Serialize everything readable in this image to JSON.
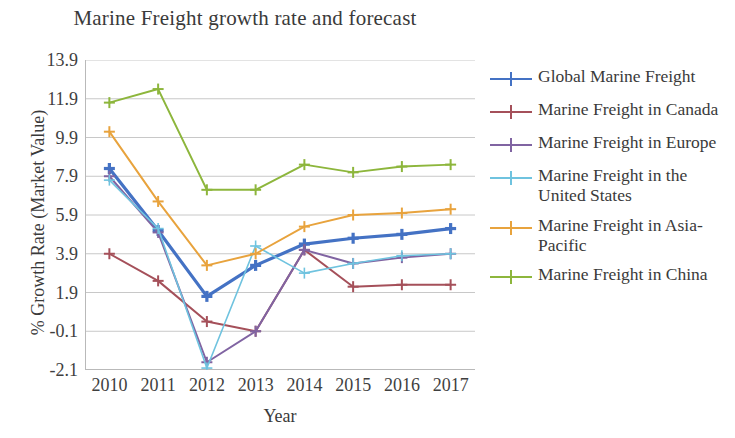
{
  "chart_data": {
    "type": "line",
    "title": "Marine Freight growth rate and forecast",
    "xlabel": "Year",
    "ylabel": "% Growth Rate (Market Value)",
    "categories": [
      "2010",
      "2011",
      "2012",
      "2013",
      "2014",
      "2015",
      "2016",
      "2017"
    ],
    "x_tick_labels": [
      "2010",
      "2011",
      "2012",
      "2013",
      "2014",
      "2015",
      "2016",
      "2017"
    ],
    "y_tick_labels": [
      "13.9",
      "11.9",
      "9.9",
      "7.9",
      "5.9",
      "3.9",
      "1.9",
      "-0.1",
      "-2.1"
    ],
    "y_ticks": [
      13.9,
      11.9,
      9.9,
      7.9,
      5.9,
      3.9,
      1.9,
      -0.1,
      -2.1
    ],
    "ylim": [
      -2.1,
      13.9
    ],
    "grid": true,
    "legend_position": "right",
    "marker": "plus",
    "series": [
      {
        "name": "Global Marine Freight",
        "color": "#4472c4",
        "width": 3.2,
        "values": [
          8.3,
          5.1,
          1.7,
          3.3,
          4.4,
          4.7,
          4.9,
          5.2
        ]
      },
      {
        "name": "Marine Freight in Canada",
        "color": "#a5505a",
        "width": 2.0,
        "values": [
          3.9,
          2.5,
          0.4,
          -0.1,
          4.1,
          2.2,
          2.3,
          2.3
        ]
      },
      {
        "name": "Marine Freight in Europe",
        "color": "#8064a2",
        "width": 2.0,
        "values": [
          7.9,
          5.0,
          -1.7,
          -0.1,
          4.1,
          3.4,
          3.7,
          3.9
        ]
      },
      {
        "name": "Marine Freight in the United States",
        "color": "#6fc3df",
        "width": 1.6,
        "values": [
          7.7,
          5.2,
          -2.0,
          4.3,
          2.9,
          3.4,
          3.8,
          3.9
        ]
      },
      {
        "name": "Marine Freight in Asia-Pacific",
        "color": "#e8a33d",
        "width": 2.0,
        "values": [
          10.2,
          6.6,
          3.3,
          3.9,
          5.3,
          5.9,
          6.0,
          6.2
        ]
      },
      {
        "name": "Marine Freight in China",
        "color": "#8db63c",
        "width": 2.0,
        "values": [
          11.7,
          12.4,
          7.2,
          7.2,
          8.5,
          8.1,
          8.4,
          8.5
        ]
      }
    ]
  },
  "legend": {
    "items": [
      {
        "label": "Global Marine Freight"
      },
      {
        "label": "Marine Freight in Canada"
      },
      {
        "label": "Marine Freight in Europe"
      },
      {
        "label": "Marine Freight in the United States"
      },
      {
        "label": "Marine Freight in Asia-Pacific"
      },
      {
        "label": "Marine Freight in China"
      }
    ]
  }
}
